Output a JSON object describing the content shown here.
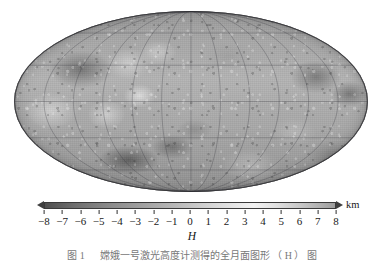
{
  "figure": {
    "caption": "图 1 　 嫦娥一号激光高度计测得的全月面图形 （ H ） 图",
    "map": {
      "name": "lunar-topography-mollweide-map",
      "projection": "Mollweide",
      "graticule_lon_step_deg": 30,
      "graticule_lat_step_deg": 30,
      "body": "Moon",
      "quantity": "H"
    }
  },
  "colorbar": {
    "name": "elevation-colorbar",
    "quantity_label": "H",
    "unit": "km",
    "min": -8,
    "max": 8,
    "tick_values": [
      -8,
      -7,
      -6,
      -5,
      -4,
      -3,
      -2,
      -1,
      0,
      1,
      2,
      3,
      4,
      5,
      6,
      7,
      8
    ],
    "tick_labels": [
      "−8",
      "−7",
      "−6",
      "−5",
      "−4",
      "−3",
      "−2",
      "−1",
      "0",
      "1",
      "2",
      "3",
      "4",
      "5",
      "6",
      "7",
      "8"
    ],
    "colormap": "grayscale",
    "colors": {
      "low": "#4f4f4f",
      "mid": "#b9b9b9",
      "high": "#f2f2f2",
      "end": "#9d9d9d",
      "outline": "#3a3a3a",
      "text": "#1a1a1a"
    },
    "extend_both_ends": true
  },
  "chart_data": {
    "type": "heatmap",
    "title": "",
    "xlabel": "",
    "ylabel": "",
    "colorbar_label": "H",
    "colorbar_unit": "km",
    "clim": [
      -8,
      8
    ],
    "colorbar_ticks": [
      -8,
      -7,
      -6,
      -5,
      -4,
      -3,
      -2,
      -1,
      0,
      1,
      2,
      3,
      4,
      5,
      6,
      7,
      8
    ],
    "projection": "Mollweide",
    "grid": true,
    "legend_position": "below",
    "x_range_deg": [
      -180,
      180
    ],
    "y_range_deg": [
      -90,
      90
    ],
    "graticule_meridians_deg": [
      -180,
      -150,
      -120,
      -90,
      -60,
      -30,
      0,
      30,
      60,
      90,
      120,
      150,
      180
    ],
    "graticule_parallels_deg": [
      -60,
      -30,
      0,
      30,
      60
    ]
  }
}
